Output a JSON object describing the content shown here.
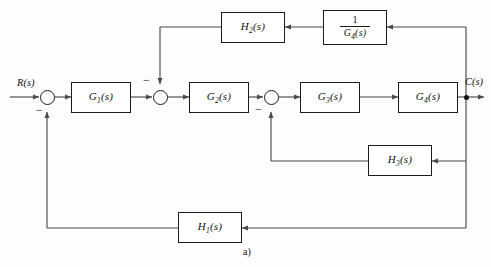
{
  "figure": {
    "caption": "a)",
    "type": "control-system-block-diagram",
    "line_color": "#4a4a4a",
    "box_border_color": "#1b1b1b",
    "background": "#ffffff"
  },
  "signals": {
    "input_label": "R(s)",
    "output_label": "C(s)"
  },
  "blocks": [
    {
      "id": "G1",
      "base": "G",
      "sub": "1",
      "arg": "(s)",
      "role": "forward-path-block"
    },
    {
      "id": "G2",
      "base": "G",
      "sub": "2",
      "arg": "(s)",
      "role": "forward-path-block"
    },
    {
      "id": "G3",
      "base": "G",
      "sub": "3",
      "arg": "(s)",
      "role": "forward-path-block"
    },
    {
      "id": "G4",
      "base": "G",
      "sub": "4",
      "arg": "(s)",
      "role": "forward-path-block"
    },
    {
      "id": "H1",
      "base": "H",
      "sub": "1",
      "arg": "(s)",
      "role": "outer-feedback-block"
    },
    {
      "id": "H2",
      "base": "H",
      "sub": "2",
      "arg": "(s)",
      "role": "inner-feedback-block"
    },
    {
      "id": "H3",
      "base": "H",
      "sub": "3",
      "arg": "(s)",
      "role": "inner-feedback-block"
    },
    {
      "id": "invG4",
      "numerator": "1",
      "den_base": "G",
      "den_sub": "4",
      "den_arg": "(s)",
      "role": "inverse-gain-block"
    }
  ],
  "summing_junctions": [
    {
      "id": "sum1",
      "sign_label": "−",
      "note": "R(s) with H1 feedback"
    },
    {
      "id": "sum2",
      "sign_label": "−",
      "note": "G1 output with H2 feedback"
    },
    {
      "id": "sum3",
      "sign_label": "−",
      "note": "G2 output with H3 feedback"
    }
  ]
}
